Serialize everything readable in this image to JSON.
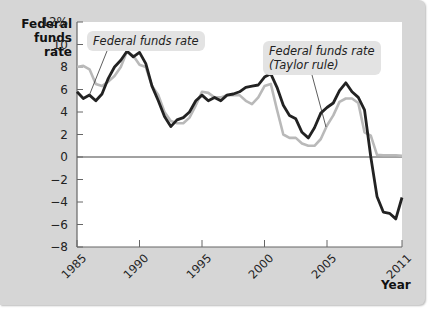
{
  "chart_data": {
    "type": "line",
    "title": "",
    "ylabel": "Federal funds rate",
    "xlabel": "Year",
    "ylim": [
      -8,
      12
    ],
    "xlim": [
      1985,
      2011
    ],
    "y_ticks": [
      "12%",
      "10",
      "8",
      "6",
      "4",
      "2",
      "0",
      "−2",
      "−4",
      "−6",
      "−8"
    ],
    "x_ticks": [
      "1985",
      "1990",
      "1995",
      "2000",
      "2005",
      "2011"
    ],
    "grid": false,
    "legend_position": "callouts",
    "series": [
      {
        "name": "Federal funds rate",
        "color": "#b9b9b9",
        "x": [
          1985,
          1985.5,
          1986,
          1986.5,
          1987,
          1987.5,
          1988,
          1988.5,
          1989,
          1989.5,
          1990,
          1990.5,
          1991,
          1991.5,
          1992,
          1992.5,
          1993,
          1993.5,
          1994,
          1994.5,
          1995,
          1995.5,
          1996,
          1996.5,
          1997,
          1997.5,
          1998,
          1998.5,
          1999,
          1999.5,
          2000,
          2000.5,
          2001,
          2001.5,
          2002,
          2002.5,
          2003,
          2003.5,
          2004,
          2004.5,
          2005,
          2005.5,
          2006,
          2006.5,
          2007,
          2007.5,
          2008,
          2008.5,
          2009,
          2009.5,
          2010,
          2010.5,
          2011
        ],
        "values": [
          8.0,
          8.1,
          7.8,
          6.5,
          6.3,
          6.7,
          7.2,
          8.0,
          9.4,
          9.0,
          8.2,
          8.0,
          6.3,
          5.5,
          4.0,
          3.2,
          3.0,
          3.0,
          3.5,
          4.6,
          5.8,
          5.7,
          5.3,
          5.3,
          5.5,
          5.5,
          5.5,
          5.0,
          4.7,
          5.3,
          6.3,
          6.5,
          4.2,
          2.0,
          1.7,
          1.7,
          1.2,
          1.0,
          1.0,
          1.6,
          2.8,
          3.7,
          4.9,
          5.2,
          5.2,
          4.8,
          2.2,
          1.9,
          0.2,
          0.15,
          0.15,
          0.15,
          0.1
        ]
      },
      {
        "name": "Federal funds rate (Taylor rule)",
        "color": "#222222",
        "x": [
          1985,
          1985.5,
          1986,
          1986.5,
          1987,
          1987.5,
          1988,
          1988.5,
          1989,
          1989.5,
          1990,
          1990.5,
          1991,
          1991.5,
          1992,
          1992.5,
          1993,
          1993.5,
          1994,
          1994.5,
          1995,
          1995.5,
          1996,
          1996.5,
          1997,
          1997.5,
          1998,
          1998.5,
          1999,
          1999.5,
          2000,
          2000.5,
          2001,
          2001.5,
          2002,
          2002.5,
          2003,
          2003.5,
          2004,
          2004.5,
          2005,
          2005.5,
          2006,
          2006.5,
          2007,
          2007.5,
          2008,
          2008.5,
          2009,
          2009.5,
          2010,
          2010.5,
          2011
        ],
        "values": [
          5.8,
          5.2,
          5.5,
          5.0,
          5.6,
          7.0,
          8.0,
          8.6,
          9.4,
          8.9,
          9.3,
          8.3,
          6.3,
          5.0,
          3.6,
          2.7,
          3.3,
          3.5,
          4.0,
          5.0,
          5.5,
          5.0,
          5.3,
          5.0,
          5.5,
          5.6,
          5.8,
          6.2,
          6.3,
          6.4,
          7.1,
          7.4,
          6.2,
          4.6,
          3.7,
          3.4,
          2.2,
          1.7,
          2.6,
          3.9,
          4.4,
          4.8,
          5.9,
          6.6,
          5.8,
          5.3,
          4.2,
          0.0,
          -3.5,
          -4.9,
          -5.0,
          -5.5,
          -3.6
        ]
      }
    ],
    "annotations": [
      "Federal funds rate",
      "Federal funds rate (Taylor rule)"
    ]
  },
  "axis": {
    "ylabel_line1": "Federal",
    "ylabel_line2": "funds rate",
    "xlabel": "Year",
    "yticks": [
      {
        "label": "12%",
        "value": 12
      },
      {
        "label": "10",
        "value": 10
      },
      {
        "label": "8",
        "value": 8
      },
      {
        "label": "6",
        "value": 6
      },
      {
        "label": "4",
        "value": 4
      },
      {
        "label": "2",
        "value": 2
      },
      {
        "label": "0",
        "value": 0
      },
      {
        "label": "−2",
        "value": -2
      },
      {
        "label": "−4",
        "value": -4
      },
      {
        "label": "−6",
        "value": -6
      },
      {
        "label": "−8",
        "value": -8
      }
    ],
    "xticks": [
      {
        "label": "1985",
        "value": 1985
      },
      {
        "label": "1990",
        "value": 1990
      },
      {
        "label": "1995",
        "value": 1995
      },
      {
        "label": "2000",
        "value": 2000
      },
      {
        "label": "2005",
        "value": 2005
      },
      {
        "label": "2011",
        "value": 2011
      }
    ]
  },
  "callouts": {
    "actual": "Federal funds rate",
    "taylor_line1": "Federal funds rate",
    "taylor_line2": "(Taylor rule)"
  },
  "colors": {
    "panel": "#d6d6d6",
    "plot": "#ffffff",
    "actual": "#b9b9b9",
    "taylor": "#222222",
    "callout_bg": "#e3e3e3"
  }
}
